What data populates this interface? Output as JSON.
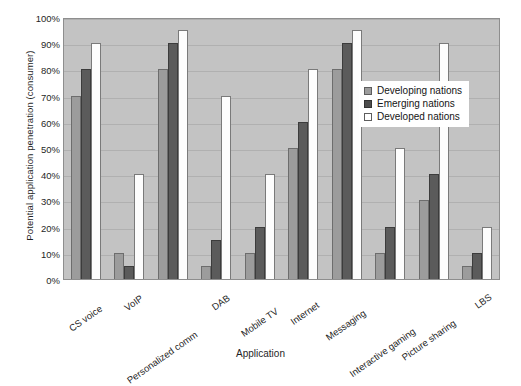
{
  "chart_data": {
    "type": "bar",
    "title": "",
    "xlabel": "Application",
    "ylabel": "Potential application penetration (consumer)",
    "ylim": [
      0,
      100
    ],
    "yticks": [
      "0%",
      "10%",
      "20%",
      "30%",
      "40%",
      "50%",
      "60%",
      "70%",
      "80%",
      "90%",
      "100%"
    ],
    "ytick_values": [
      0,
      10,
      20,
      30,
      40,
      50,
      60,
      70,
      80,
      90,
      100
    ],
    "grid": true,
    "legend_position": "inside-right",
    "categories": [
      "CS voice",
      "VoIP",
      "Personalized comm",
      "DAB",
      "Mobile TV",
      "Internet",
      "Messaging",
      "Interactive gaming",
      "Picture sharing",
      "LBS"
    ],
    "series": [
      {
        "name": "Developing nations",
        "color": "#9c9c9c",
        "values": [
          70,
          10,
          80,
          5,
          10,
          50,
          80,
          10,
          30,
          5
        ]
      },
      {
        "name": "Emerging nations",
        "color": "#5b5b5b",
        "values": [
          80,
          5,
          90,
          15,
          20,
          60,
          90,
          20,
          40,
          10
        ]
      },
      {
        "name": "Developed nations",
        "color": "#ffffff",
        "values": [
          90,
          40,
          95,
          70,
          40,
          80,
          95,
          50,
          90,
          20
        ]
      }
    ]
  },
  "style": {
    "plot_background": "#c3c3c3",
    "gridline_color": "#b0b0b0",
    "axis_color": "#8e8e8e",
    "text_color": "#1f1f1f"
  }
}
